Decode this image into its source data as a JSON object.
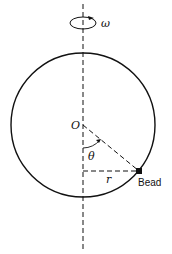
{
  "diagram": {
    "type": "physics-figure",
    "labels": {
      "omega": "ω",
      "center": "O",
      "angle": "θ",
      "radius_horizontal": "r",
      "bead": "Bead"
    },
    "geometry": {
      "circle_center": [
        83,
        125
      ],
      "circle_radius": 72,
      "axis_x": 83,
      "bead_position": [
        139,
        171
      ]
    },
    "colors": {
      "stroke": "#111111",
      "background": "#ffffff"
    }
  }
}
